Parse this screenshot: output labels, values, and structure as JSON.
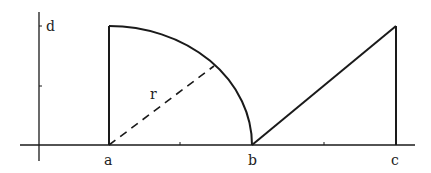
{
  "diagram": {
    "labels": {
      "a": "a",
      "b": "b",
      "c": "c",
      "d": "d",
      "r": "r"
    },
    "colors": {
      "stroke": "#1a1a1a",
      "background": "#ffffff"
    }
  }
}
